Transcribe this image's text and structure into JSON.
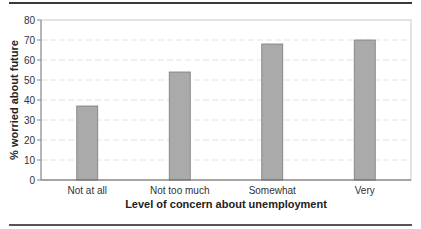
{
  "chart_data": {
    "type": "bar",
    "title": "",
    "xlabel": "Level of concern about unemployment",
    "ylabel": "% worried about future",
    "categories": [
      "Not at all",
      "Not too much",
      "Somewhat",
      "Very"
    ],
    "values": [
      37,
      54,
      68,
      70
    ],
    "ylim": [
      0,
      80
    ],
    "yticks": [
      0,
      10,
      20,
      30,
      40,
      50,
      60,
      70,
      80
    ],
    "grid": true,
    "legend": null,
    "bar_color": "#aaaaaa",
    "bar_edge_color": "#7a7a7a"
  }
}
